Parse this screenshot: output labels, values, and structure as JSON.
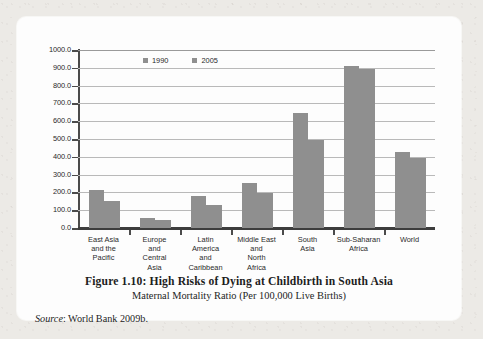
{
  "figure": {
    "title": "Figure 1.10: High Risks of Dying at Childbirth in South Asia",
    "subtitle": "Maternal Mortality Ratio (Per 100,000 Live Births)",
    "source_label": "Source",
    "source_text": ": World Bank 2009b."
  },
  "colors": {
    "bar": "#8f8f8f",
    "gridline": "#b9b9b9",
    "axis": "#3d3d3d",
    "card": "#fdfdfd",
    "page": "#eceae6"
  },
  "chart_data": {
    "type": "bar",
    "title": "Figure 1.10: High Risks of Dying at Childbirth in South Asia",
    "subtitle": "Maternal Mortality Ratio (Per 100,000 Live Births)",
    "xlabel": "",
    "ylabel": "",
    "ylim": [
      0,
      1000
    ],
    "grid": true,
    "legend_position": "top-left-inside",
    "ytick_labels": [
      "0.0",
      "100.0",
      "200.0",
      "300.0",
      "400.0",
      "500.0",
      "600.0",
      "700.0",
      "800.0",
      "900.0",
      "1000.0"
    ],
    "ytick_values": [
      0,
      100,
      200,
      300,
      400,
      500,
      600,
      700,
      800,
      900,
      1000
    ],
    "categories": [
      "East Asia and the Pacific",
      "Europe and Central Asia",
      "Latin America and Caribbean",
      "Middle East and North Africa",
      "South Asia",
      "Sub-Saharan Africa",
      "World"
    ],
    "category_lines": [
      [
        "East Asia",
        "and the",
        "Pacific"
      ],
      [
        "Europe",
        "and",
        "Central",
        "Asia"
      ],
      [
        "Latin",
        "America",
        "and",
        "Caribbean"
      ],
      [
        "Middle East",
        "and",
        "North",
        "Africa"
      ],
      [
        "South",
        "Asia"
      ],
      [
        "Sub-Saharan",
        "Africa"
      ],
      [
        "World"
      ]
    ],
    "series": [
      {
        "name": "1990",
        "color": "#8f8f8f",
        "values": [
          215,
          58,
          180,
          255,
          645,
          910,
          425
        ]
      },
      {
        "name": "2005",
        "color": "#8f8f8f",
        "values": [
          150,
          45,
          130,
          197,
          495,
          895,
          395
        ]
      }
    ]
  }
}
